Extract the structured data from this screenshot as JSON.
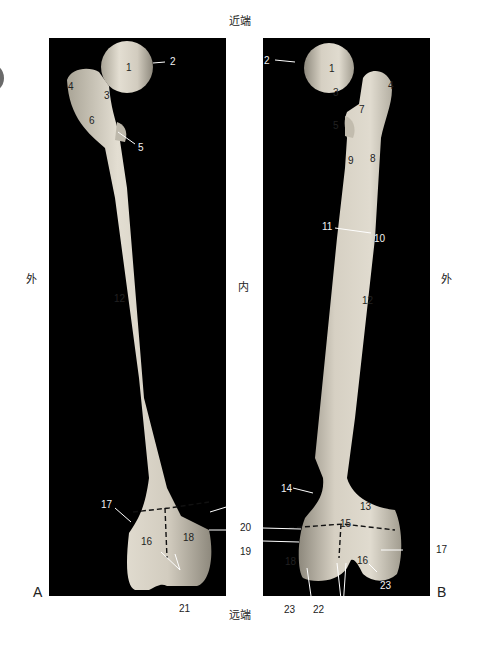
{
  "figure": {
    "panels": [
      {
        "id": "A",
        "letter": "A"
      },
      {
        "id": "B",
        "letter": "B"
      }
    ],
    "directions": {
      "top": "近端",
      "bottom": "远端",
      "left_a": "外",
      "center": "内",
      "right_b": "外"
    },
    "colors": {
      "background": "#ffffff",
      "panel_bg": "#000000",
      "bone": "#d9d4c8",
      "leader_line": "#ffffff",
      "tab_marker": "#6a6a6a"
    },
    "labels_a": {
      "l1": "1",
      "l2": "2",
      "l3": "3",
      "l4": "4",
      "l5": "5",
      "l6": "6",
      "l12": "12",
      "l16": "16",
      "l17": "17",
      "l18": "18",
      "l19": "19",
      "l20": "20",
      "l21": "21"
    },
    "labels_b": {
      "l1": "1",
      "l2": "2",
      "l3": "3",
      "l4": "4",
      "l5": "5",
      "l7": "7",
      "l8": "8",
      "l9": "9",
      "l10": "10",
      "l11": "11",
      "l12": "12",
      "l13": "13",
      "l14": "14",
      "l15": "15",
      "l16": "16",
      "l17": "17",
      "l18": "18",
      "l22": "22",
      "l23a": "23",
      "l23b": "23"
    }
  }
}
